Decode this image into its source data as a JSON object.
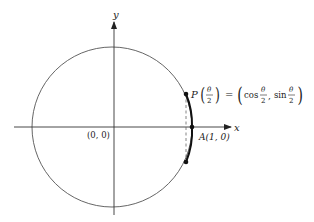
{
  "diagram": {
    "type": "unit-circle",
    "axes": {
      "x_label": "x",
      "y_label": "y",
      "origin_label": "(0, 0)"
    },
    "points": {
      "P": {
        "name": "P",
        "arg_num": "θ",
        "arg_den": "2",
        "equals": "=",
        "cos_text": "cos",
        "sin_text": "sin",
        "frac_num": "θ",
        "frac_den": "2",
        "comma": ","
      },
      "A": {
        "label": "A(1, 0)"
      }
    },
    "colors": {
      "circle": "#555555",
      "axis": "#333333",
      "arc": "#111111",
      "dashed": "#666666"
    }
  }
}
